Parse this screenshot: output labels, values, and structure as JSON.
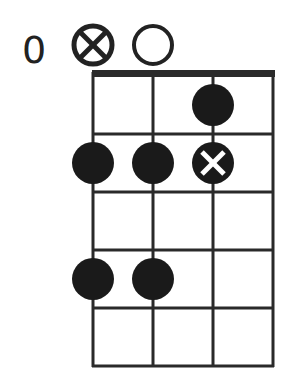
{
  "diagram": {
    "type": "chord-diagram",
    "fret_label": "0",
    "strings": 4,
    "frets": 5,
    "open_markers": [
      {
        "string": 1,
        "marker": "circle-x"
      },
      {
        "string": 2,
        "marker": "open-circle"
      }
    ],
    "dots": [
      {
        "string": 3,
        "fret": 1,
        "style": "filled"
      },
      {
        "string": 1,
        "fret": 2,
        "style": "filled"
      },
      {
        "string": 2,
        "fret": 2,
        "style": "filled"
      },
      {
        "string": 3,
        "fret": 2,
        "style": "filled-x"
      },
      {
        "string": 1,
        "fret": 4,
        "style": "filled"
      },
      {
        "string": 2,
        "fret": 4,
        "style": "filled"
      }
    ],
    "colors": {
      "line": "#2a2a2a",
      "dot": "#1a1a1a",
      "background": "#ffffff"
    }
  }
}
